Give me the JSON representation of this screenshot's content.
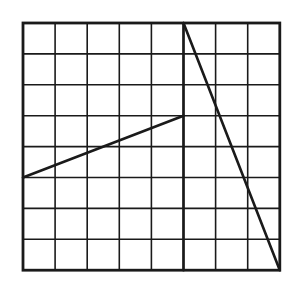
{
  "diagram": {
    "type": "grid-with-segments",
    "grid": {
      "columns": 8,
      "rows": 8,
      "origin_px": [
        23,
        23
      ],
      "cell_width_px": 32.1,
      "cell_height_px": 30.9,
      "line_color": "#1a1a1a",
      "background": "#ffffff"
    },
    "segments": [
      {
        "name": "vertical-divider",
        "from": [
          5,
          0
        ],
        "to": [
          5,
          8
        ]
      },
      {
        "name": "slanted-segment-left",
        "from": [
          0,
          5
        ],
        "to": [
          5,
          3
        ]
      },
      {
        "name": "diagonal-segment-right",
        "from": [
          5,
          0
        ],
        "to": [
          8,
          8
        ]
      }
    ]
  }
}
